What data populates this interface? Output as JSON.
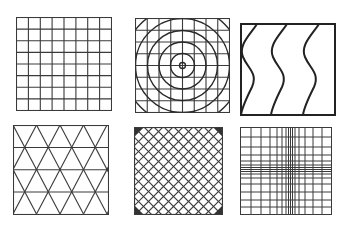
{
  "figure": {
    "stroke_color": "#333333",
    "background": "#ffffff",
    "panels": [
      {
        "id": "regular-grid",
        "label": "Regular square grid",
        "divisions": 8,
        "x": 16,
        "y": 17,
        "w": 95,
        "h": 93
      },
      {
        "id": "grid-with-concentric-circles",
        "label": "Square grid with concentric circles",
        "divisions": 8,
        "rings": 5,
        "x": 135,
        "y": 18,
        "w": 94,
        "h": 94
      },
      {
        "id": "wavy-lines",
        "label": "Vertical sinusoidal lines",
        "waves": 3,
        "x": 240,
        "y": 23,
        "w": 95,
        "h": 92
      },
      {
        "id": "triangular-grid",
        "label": "Triangular lattice",
        "rows": 4,
        "x": 13,
        "y": 125,
        "w": 95,
        "h": 89
      },
      {
        "id": "diagonal-crosshatch",
        "label": "Diagonal crosshatch",
        "x": 134,
        "y": 127,
        "w": 88,
        "h": 87
      },
      {
        "id": "graded-grid",
        "label": "Grid densifying toward center",
        "x": 240,
        "y": 127,
        "w": 91,
        "h": 87
      }
    ]
  }
}
